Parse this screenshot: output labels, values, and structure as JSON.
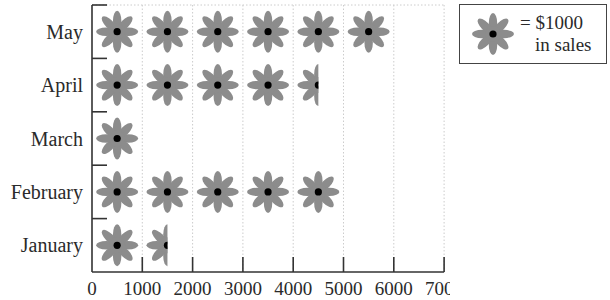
{
  "chart_data": {
    "type": "pictograph",
    "title": "",
    "xlabel": "",
    "ylabel": "",
    "unit_value": 1000,
    "unit_label": "$1000 in sales",
    "categories": [
      "May",
      "April",
      "March",
      "February",
      "January"
    ],
    "values": [
      6000,
      4500,
      1000,
      5000,
      1500
    ],
    "icon_counts": [
      6,
      4.5,
      1,
      5,
      1.5
    ],
    "xlim": [
      0,
      7000
    ],
    "xticks": [
      0,
      1000,
      2000,
      3000,
      4000,
      5000,
      6000,
      7000
    ],
    "grid": "vertical dotted",
    "legend_position": "top-right"
  },
  "legend": {
    "equals": "= $1000",
    "line2": "in sales",
    "icon": "flower-icon"
  },
  "colors": {
    "petal": "#8c8c8c",
    "center": "#000000",
    "axis": "#333333",
    "grid": "#cccccc"
  }
}
